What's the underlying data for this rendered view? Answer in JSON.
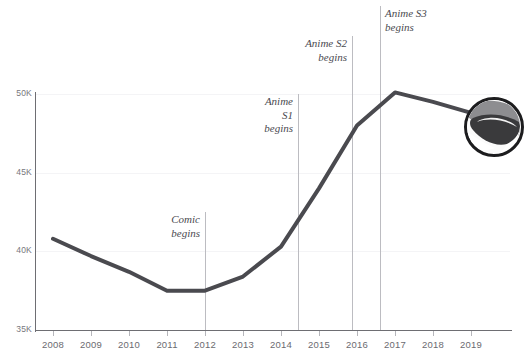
{
  "chart_data": {
    "type": "line",
    "title": "",
    "subtitle": "",
    "xlabel": "",
    "ylabel": "",
    "x": [
      2008,
      2009,
      2010,
      2011,
      2012,
      2013,
      2014,
      2015,
      2016,
      2017,
      2018,
      2019
    ],
    "categories": [
      "2008",
      "2009",
      "2010",
      "2011",
      "2012",
      "2013",
      "2014",
      "2015",
      "2016",
      "2017",
      "2018",
      "2019"
    ],
    "values": [
      40800,
      39700,
      38700,
      37500,
      37500,
      38400,
      40300,
      44000,
      48000,
      50100,
      49500,
      48800
    ],
    "series": [
      {
        "name": "value",
        "values": [
          40800,
          39700,
          38700,
          37500,
          37500,
          38400,
          40300,
          44000,
          48000,
          50100,
          49500,
          48800
        ]
      }
    ],
    "xlim": [
      2008,
      2019
    ],
    "ylim": [
      35000,
      50000
    ],
    "yticks": [
      35000,
      40000,
      45000,
      50000
    ],
    "ytick_labels": [
      "35K",
      "40K",
      "45K",
      "50K"
    ],
    "xtick_labels": [
      "2008",
      "2009",
      "2010",
      "2011",
      "2012",
      "2013",
      "2014",
      "2015",
      "2016",
      "2017",
      "2018",
      "2019"
    ],
    "grid": "horizontal-faint",
    "legend": "none",
    "line_color": "#4a4a4f",
    "line_width": 4,
    "annotations": [
      {
        "label": "Comic\nbegins",
        "x": 2012,
        "align": "right",
        "rule_top": 212,
        "rule_bottom": 330
      },
      {
        "label": "Anime\nS1\nbegins",
        "x": 2014.7,
        "align": "right",
        "rule_top": 94,
        "rule_bottom": 330
      },
      {
        "label": "Anime S2\nbegins",
        "x": 2015.8,
        "align": "right",
        "rule_top": 35,
        "rule_bottom": 330
      },
      {
        "label": "Anime S3\nbegins",
        "x": 2016.8,
        "align": "left",
        "rule_top": 5,
        "rule_bottom": 330
      }
    ]
  },
  "axes": {
    "y_tick_labels": [
      "50K",
      "45K",
      "40K",
      "35K"
    ],
    "x_tick_labels": [
      "2008",
      "2009",
      "2010",
      "2011",
      "2012",
      "2013",
      "2014",
      "2015",
      "2016",
      "2017",
      "2018",
      "2019"
    ],
    "axis_color": "#6e6e73",
    "grid_color": "#f4f4f6"
  },
  "annotations": {
    "comic": {
      "line1": "Comic",
      "line2": "begins"
    },
    "anime_s1": {
      "line1": "Anime",
      "line2": "S1",
      "line3": "begins"
    },
    "anime_s2": {
      "line1": "Anime S2",
      "line2": "begins"
    },
    "anime_s3": {
      "line1": "Anime S3",
      "line2": "begins"
    }
  },
  "cropped_text": {
    "top": "",
    "bottom": ""
  },
  "inset": {
    "alt": "circular-photo-thumbnail",
    "border_color": "#1c1c1e"
  },
  "colors": {
    "line": "#4a4a4f",
    "axis": "#6e6e73",
    "grid": "#f4f4f6",
    "rule": "#bcbcc1",
    "tick_text": "#6b6b70",
    "annotation_text": "#4a4a50",
    "background": "#ffffff"
  }
}
